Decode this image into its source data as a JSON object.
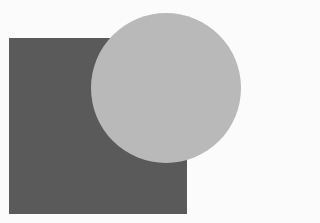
{
  "canvas": {
    "width": 251,
    "height": 223,
    "background": "#fbfbfb"
  },
  "shapes": {
    "square": {
      "x": 9,
      "y": 38,
      "width": 178,
      "height": 176,
      "color": "#5a5a5a"
    },
    "circle": {
      "cx": 166,
      "cy": 88,
      "r": 75,
      "color": "#b9b9b9"
    }
  }
}
